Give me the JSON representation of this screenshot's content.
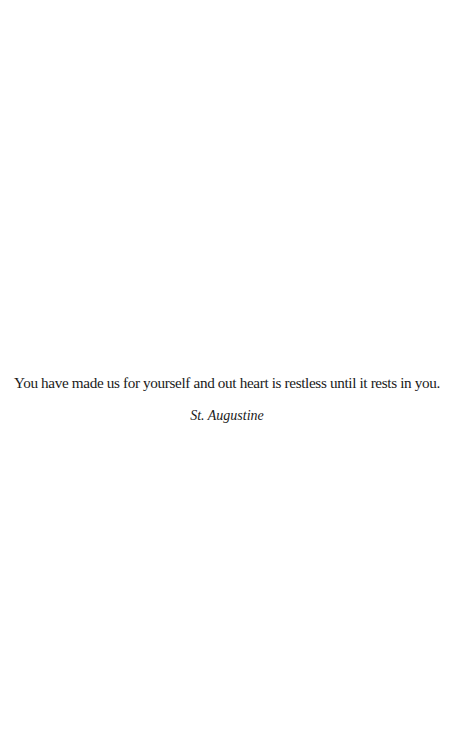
{
  "quote": {
    "text": "You have made us for yourself and out heart is restless until it rests in you.",
    "author": "St. Augustine"
  },
  "colors": {
    "background": "#ffffff",
    "text": "#1a1a1a"
  }
}
